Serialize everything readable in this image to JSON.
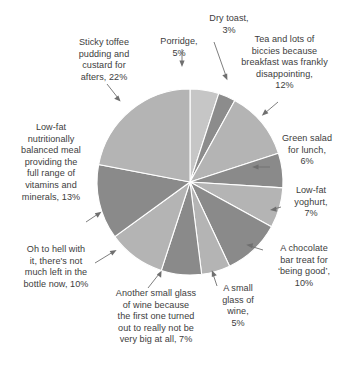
{
  "chart_data": {
    "type": "pie",
    "title": "",
    "subtitle": "",
    "xlabel": "",
    "ylabel": "",
    "legend_position": "none",
    "grid": false,
    "units": "percent",
    "total": 100,
    "start_angle_deg": 0,
    "direction": "clockwise",
    "labels_placement": "outside with leader arrows",
    "categories": [
      "Porridge",
      "Dry toast",
      "Tea and lots of biccies because breakfast was frankly disappointing",
      "Green salad for lunch",
      "Low-fat yoghurt",
      "A chocolate bar treat for ‘being good’",
      "A small glass of wine",
      "Another small glass of wine because the first one turned out to really not be very big at all",
      "Oh to hell with it, there's not much left in the bottle now",
      "Low-fat nutritionally balanced meal providing the full range of vitamins and minerals",
      "Sticky toffee pudding and custard for afters"
    ],
    "values": [
      5,
      3,
      12,
      6,
      7,
      10,
      5,
      7,
      10,
      13,
      22
    ],
    "slice_colors": [
      "#c6c6c6",
      "#8c8c8c",
      "#b4b4b4",
      "#8a8a8a",
      "#b4b4b4",
      "#8a8a8a",
      "#b4b4b4",
      "#8a8a8a",
      "#b4b4b4",
      "#8a8a8a",
      "#b4b4b4"
    ],
    "slices": [
      {
        "label": "Porridge",
        "value": 5,
        "percent_text": "5%",
        "color": "#c6c6c6"
      },
      {
        "label": "Dry toast",
        "value": 3,
        "percent_text": "3%",
        "color": "#8c8c8c"
      },
      {
        "label": "Tea and lots of biccies because breakfast was frankly disappointing",
        "value": 12,
        "percent_text": "12%",
        "color": "#b4b4b4"
      },
      {
        "label": "Green salad for lunch",
        "value": 6,
        "percent_text": "6%",
        "color": "#8a8a8a"
      },
      {
        "label": "Low-fat yoghurt",
        "value": 7,
        "percent_text": "7%",
        "color": "#b4b4b4"
      },
      {
        "label": "A chocolate bar treat for ‘being good’",
        "value": 10,
        "percent_text": "10%",
        "color": "#8a8a8a"
      },
      {
        "label": "A small glass of wine",
        "value": 5,
        "percent_text": "5%",
        "color": "#b4b4b4"
      },
      {
        "label": "Another small glass of wine because the first one turned out to really not be very big at all",
        "value": 7,
        "percent_text": "7%",
        "color": "#8a8a8a"
      },
      {
        "label": "Oh to hell with it, there's not much left in the bottle now",
        "value": 10,
        "percent_text": "10%",
        "color": "#b4b4b4"
      },
      {
        "label": "Low-fat nutritionally balanced meal providing the full range of vitamins and minerals",
        "value": 13,
        "percent_text": "13%",
        "color": "#8a8a8a"
      },
      {
        "label": "Sticky toffee pudding and custard for afters",
        "value": 22,
        "percent_text": "22%",
        "color": "#b4b4b4"
      }
    ]
  },
  "labels": {
    "porridge": "Porridge,\n5%",
    "dry_toast": "Dry toast,\n3%",
    "tea_biccies": "Tea and lots of\nbiccies because\nbreakfast was frankly\ndisappointing,\n12%",
    "green_salad": "Green salad\nfor lunch,\n6%",
    "low_fat_yoghurt": "Low-fat\nyoghurt,\n7%",
    "chocolate_bar": "A chocolate\nbar treat for\n‘being good’,\n10%",
    "small_glass_wine": "A small\nglass of\nwine,\n5%",
    "another_glass_wine": "Another small glass\nof wine because\nthe first one turned\nout to really not be\nvery big at all, 7%",
    "bottle_now": "Oh to hell with\nit, there's not\nmuch left in the\nbottle now, 10%",
    "low_fat_meal": "Low-fat\nnutritionally\nbalanced meal\nproviding the\nfull range of\nvitamins and\nminerals, 13%",
    "sticky_toffee": "Sticky toffee\npudding and\ncustard for\nafters, 22%"
  },
  "style": {
    "background": "#ffffff",
    "text_color": "#3d3d3d",
    "leader_color": "#6f6f6f",
    "slice_divider": "#ffffff",
    "light_slice": "#b4b4b4",
    "dark_slice": "#8a8a8a",
    "lightest_slice": "#c6c6c6"
  },
  "geometry": {
    "center_x": 190,
    "center_y": 182,
    "radius": 93
  }
}
